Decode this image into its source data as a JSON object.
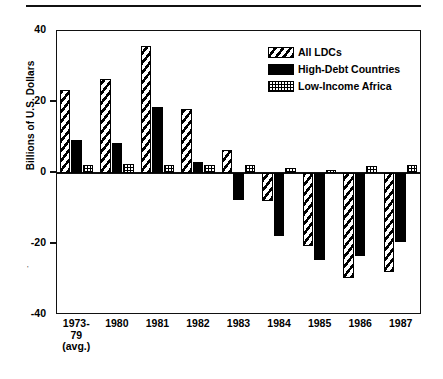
{
  "chart_data": {
    "type": "bar",
    "title": "",
    "subtitle": "",
    "xlabel": "",
    "ylabel": "Billions of U.S. Dollars",
    "ylim": [
      -40,
      40
    ],
    "yticks": [
      40,
      20,
      0,
      -20,
      -40
    ],
    "ytick_labels": [
      "40",
      "20",
      "0",
      "-20",
      "-40"
    ],
    "grid": false,
    "legend_position": "top-right",
    "categories": [
      "1973-\n79\n(avg.)",
      "1980",
      "1981",
      "1982",
      "1983",
      "1984",
      "1985",
      "1986",
      "1987"
    ],
    "series": [
      {
        "name": "All LDCs",
        "pattern": "diagonal-hatch",
        "values": [
          23.4,
          26.6,
          35.8,
          18.0,
          6.5,
          -8.0,
          -20.5,
          -29.5,
          -28.0
        ]
      },
      {
        "name": "High-Debt Countries",
        "pattern": "solid-black",
        "values": [
          9.3,
          8.5,
          18.5,
          3.2,
          -7.5,
          -17.8,
          -24.5,
          -23.5,
          -19.5
        ]
      },
      {
        "name": "Low-Income Africa",
        "pattern": "dotted-grid",
        "values": [
          2.2,
          2.5,
          2.3,
          2.3,
          2.2,
          1.5,
          0.8,
          2.0,
          2.2
        ]
      }
    ]
  },
  "legend": {
    "items": [
      {
        "label": "All LDCs"
      },
      {
        "label": "High-Debt Countries"
      },
      {
        "label": "Low-Income Africa"
      }
    ]
  },
  "axes": {
    "y_title": "Billions of U.S. Dollars"
  },
  "colors": {
    "ink": "#000000",
    "background": "#ffffff"
  }
}
